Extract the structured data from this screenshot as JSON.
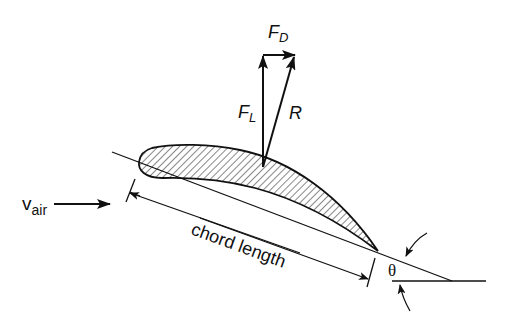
{
  "diagram": {
    "labels": {
      "drag_force": "F",
      "drag_sub": "D",
      "lift_force": "F",
      "lift_sub": "L",
      "resultant": "R",
      "air_velocity": "v",
      "air_velocity_sub": "air",
      "chord_length": "chord length",
      "angle": "θ"
    },
    "colors": {
      "ink": "#111111",
      "background": "#ffffff"
    }
  }
}
